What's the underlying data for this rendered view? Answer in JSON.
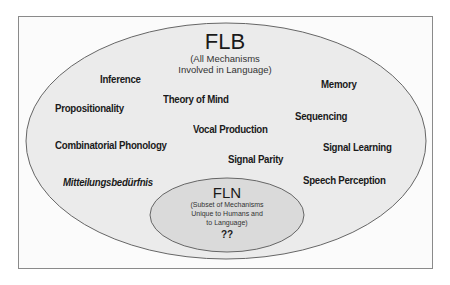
{
  "colors": {
    "outer_fill": "#ebebeb",
    "inner_fill": "#dadada",
    "stroke": "#666666",
    "text": "#1a1a1a",
    "frame": "#8a8a8a"
  },
  "flb": {
    "title": "FLB",
    "subtitle_line1": "(All Mechanisms",
    "subtitle_line2": "Involved in Language)"
  },
  "fln": {
    "title": "FLN",
    "subtitle_line1": "(Subset of Mechanisms",
    "subtitle_line2": "Unique to Humans and",
    "subtitle_line3": "to Language)",
    "content": "??"
  },
  "mechanisms": [
    {
      "label": "Inference"
    },
    {
      "label": "Memory"
    },
    {
      "label": "Propositionality"
    },
    {
      "label": "Theory of Mind"
    },
    {
      "label": "Sequencing"
    },
    {
      "label": "Combinatorial Phonology"
    },
    {
      "label": "Vocal Production"
    },
    {
      "label": "Signal Learning"
    },
    {
      "label": "Signal Parity"
    },
    {
      "label": "Mitteilungsbedürfnis"
    },
    {
      "label": "Speech Perception"
    }
  ]
}
